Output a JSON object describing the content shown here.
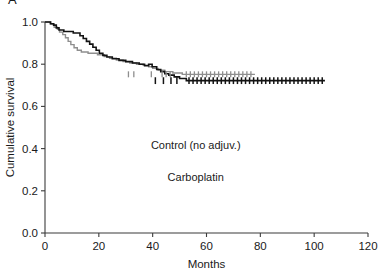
{
  "figure": {
    "panel_label": "A",
    "type": "kaplan-meier-survival-plot"
  },
  "chart_data": {
    "type": "line",
    "title": "",
    "subtitle": "",
    "xlabel": "Months",
    "ylabel": "Cumulative survival",
    "xlim": [
      0,
      120
    ],
    "ylim": [
      0,
      1.0
    ],
    "xticks": [
      0,
      20,
      40,
      60,
      80,
      100,
      120
    ],
    "xticklabels": [
      "0",
      "20",
      "40",
      "60",
      "80",
      "100",
      "120"
    ],
    "yticks": [
      0.0,
      0.2,
      0.4,
      0.6,
      0.8,
      1.0
    ],
    "yticklabels": [
      "0.0",
      "0.2",
      "0.4",
      "0.6",
      "0.8",
      "1.0"
    ],
    "grid": false,
    "legend_position": "inside-center",
    "step_style": "post",
    "annotations": [
      {
        "text": "Control (no adjuv.)",
        "x": 56,
        "y": 0.4,
        "color": "#8e8e8e"
      },
      {
        "text": "Carboplatin",
        "x": 56,
        "y": 0.245,
        "color": "#131313"
      }
    ],
    "series": [
      {
        "name": "Control (no adjuv.)",
        "color": "#8e8e8e",
        "plateau": 0.752,
        "last_follow_up_months": 78,
        "points": [
          [
            0,
            1.0
          ],
          [
            2.2,
            1.0
          ],
          [
            2.2,
            0.99
          ],
          [
            3.4,
            0.99
          ],
          [
            3.4,
            0.975
          ],
          [
            4.6,
            0.975
          ],
          [
            4.6,
            0.965
          ],
          [
            5.4,
            0.965
          ],
          [
            5.4,
            0.952
          ],
          [
            6.6,
            0.952
          ],
          [
            6.6,
            0.94
          ],
          [
            7.6,
            0.94
          ],
          [
            7.6,
            0.925
          ],
          [
            8.6,
            0.925
          ],
          [
            8.6,
            0.908
          ],
          [
            9.6,
            0.908
          ],
          [
            9.6,
            0.893
          ],
          [
            10.8,
            0.893
          ],
          [
            10.8,
            0.878
          ],
          [
            12.0,
            0.878
          ],
          [
            12.0,
            0.866
          ],
          [
            13.5,
            0.866
          ],
          [
            13.5,
            0.858
          ],
          [
            16.0,
            0.858
          ],
          [
            16.0,
            0.852
          ],
          [
            19.5,
            0.852
          ],
          [
            19.5,
            0.845
          ],
          [
            22.0,
            0.845
          ],
          [
            22.0,
            0.836
          ],
          [
            24.0,
            0.836
          ],
          [
            24.0,
            0.828
          ],
          [
            26.5,
            0.828
          ],
          [
            26.5,
            0.82
          ],
          [
            29.0,
            0.82
          ],
          [
            29.0,
            0.812
          ],
          [
            31.5,
            0.812
          ],
          [
            31.5,
            0.806
          ],
          [
            34.0,
            0.806
          ],
          [
            34.0,
            0.8
          ],
          [
            36.5,
            0.8
          ],
          [
            36.5,
            0.795
          ],
          [
            38.5,
            0.795
          ],
          [
            38.5,
            0.788
          ],
          [
            40.0,
            0.788
          ],
          [
            40.0,
            0.78
          ],
          [
            42.0,
            0.78
          ],
          [
            42.0,
            0.772
          ],
          [
            44.5,
            0.772
          ],
          [
            44.5,
            0.765
          ],
          [
            47.5,
            0.765
          ],
          [
            47.5,
            0.758
          ],
          [
            51.0,
            0.758
          ],
          [
            51.0,
            0.752
          ],
          [
            78.0,
            0.752
          ]
        ],
        "censor_months": [
          31.0,
          33.0,
          39.5,
          43.5,
          45.0,
          46.5,
          52.5,
          54.0,
          55.5,
          57.0,
          58.5,
          60.0,
          61.5,
          63.0,
          64.5,
          66.0,
          67.5,
          69.0,
          70.5,
          72.0,
          73.5,
          75.0,
          76.5
        ]
      },
      {
        "name": "Carboplatin",
        "color": "#131313",
        "plateau": 0.722,
        "last_follow_up_months": 104,
        "points": [
          [
            0,
            1.0
          ],
          [
            2.0,
            1.0
          ],
          [
            2.0,
            0.992
          ],
          [
            3.2,
            0.992
          ],
          [
            3.2,
            0.985
          ],
          [
            4.2,
            0.985
          ],
          [
            4.2,
            0.972
          ],
          [
            5.2,
            0.972
          ],
          [
            5.2,
            0.962
          ],
          [
            7.0,
            0.962
          ],
          [
            7.0,
            0.955
          ],
          [
            10.5,
            0.955
          ],
          [
            10.5,
            0.948
          ],
          [
            13.0,
            0.948
          ],
          [
            13.0,
            0.935
          ],
          [
            14.2,
            0.935
          ],
          [
            14.2,
            0.922
          ],
          [
            15.4,
            0.922
          ],
          [
            15.4,
            0.908
          ],
          [
            16.6,
            0.908
          ],
          [
            16.6,
            0.895
          ],
          [
            17.8,
            0.895
          ],
          [
            17.8,
            0.88
          ],
          [
            19.0,
            0.88
          ],
          [
            19.0,
            0.866
          ],
          [
            20.2,
            0.866
          ],
          [
            20.2,
            0.852
          ],
          [
            21.5,
            0.852
          ],
          [
            21.5,
            0.842
          ],
          [
            23.0,
            0.842
          ],
          [
            23.0,
            0.834
          ],
          [
            25.0,
            0.834
          ],
          [
            25.0,
            0.826
          ],
          [
            27.5,
            0.826
          ],
          [
            27.5,
            0.818
          ],
          [
            30.0,
            0.818
          ],
          [
            30.0,
            0.812
          ],
          [
            32.5,
            0.812
          ],
          [
            32.5,
            0.806
          ],
          [
            35.0,
            0.806
          ],
          [
            35.0,
            0.8
          ],
          [
            37.0,
            0.8
          ],
          [
            37.0,
            0.793
          ],
          [
            38.5,
            0.793
          ],
          [
            38.5,
            0.8
          ],
          [
            39.8,
            0.8
          ],
          [
            39.8,
            0.788
          ],
          [
            41.5,
            0.788
          ],
          [
            41.5,
            0.775
          ],
          [
            43.0,
            0.775
          ],
          [
            43.0,
            0.765
          ],
          [
            44.5,
            0.765
          ],
          [
            44.5,
            0.755
          ],
          [
            46.0,
            0.755
          ],
          [
            46.0,
            0.748
          ],
          [
            48.0,
            0.748
          ],
          [
            48.0,
            0.74
          ],
          [
            50.0,
            0.74
          ],
          [
            50.0,
            0.732
          ],
          [
            52.5,
            0.732
          ],
          [
            52.5,
            0.722
          ],
          [
            104.0,
            0.722
          ]
        ],
        "censor_months": [
          41.0,
          44.0,
          46.8,
          49.0,
          53.5,
          55.0,
          56.5,
          58.0,
          59.5,
          61.0,
          62.5,
          64.0,
          65.5,
          67.0,
          68.5,
          70.0,
          71.5,
          73.0,
          74.5,
          76.0,
          77.5,
          79.0,
          80.5,
          82.0,
          83.5,
          85.0,
          86.5,
          88.0,
          89.5,
          91.0,
          92.5,
          94.0,
          95.5,
          97.0,
          98.5,
          100.0,
          101.5,
          103.0
        ]
      }
    ]
  }
}
